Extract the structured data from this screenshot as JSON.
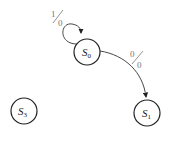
{
  "diagram": {
    "type": "state-machine",
    "states": [
      {
        "id": "S0",
        "label": "S",
        "sub": "0",
        "cx": 87,
        "cy": 52
      },
      {
        "id": "S1",
        "label": "S",
        "sub": "1",
        "cx": 147,
        "cy": 113
      },
      {
        "id": "S3",
        "label": "S",
        "sub": "3",
        "cx": 22,
        "cy": 110
      }
    ],
    "transitions": [
      {
        "from": "S0",
        "to": "S0",
        "input": "1",
        "output": "0"
      },
      {
        "from": "S0",
        "to": "S1",
        "input": "0",
        "output": "0"
      }
    ]
  }
}
